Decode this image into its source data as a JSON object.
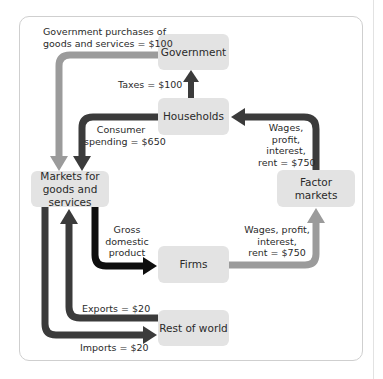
{
  "diagram": {
    "nodes": {
      "government": "Government",
      "households": "Households",
      "markets_goods": "Markets for goods and services",
      "factor_markets": "Factor markets",
      "firms": "Firms",
      "rest_of_world": "Rest of world"
    },
    "flows": {
      "gov_purchases": {
        "line1": "Government purchases of",
        "line2": "goods and services = $100"
      },
      "taxes": "Taxes = $100",
      "consumer_spending": {
        "line1": "Consumer",
        "line2": "spending = $650"
      },
      "wages_to_households": {
        "line1": "Wages,",
        "line2": "profit,",
        "line3": "interest,",
        "line4": "rent = $750"
      },
      "gdp": {
        "line1": "Gross",
        "line2": "domestic",
        "line3": "product"
      },
      "wages_from_firms": {
        "line1": "Wages, profit,",
        "line2": "interest,",
        "line3": "rent = $750"
      },
      "exports": "Exports = $20",
      "imports": "Imports = $20"
    },
    "colors": {
      "box_fill": "#e3e3e3",
      "light_arrow": "#9b9b9b",
      "dark_arrow": "#3b3b3b",
      "black_arrow": "#0e0e0e"
    }
  }
}
